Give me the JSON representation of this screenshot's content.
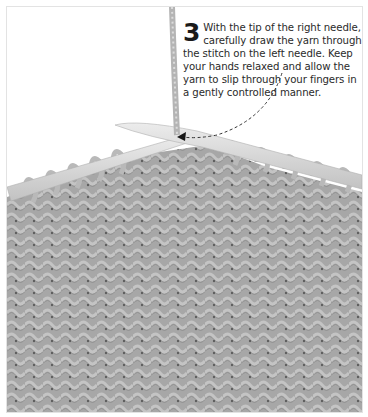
{
  "step": {
    "number": "3",
    "text": "With the tip of the right needle, carefully draw the yarn through the stitch on the left needle. Keep your hands relaxed and allow the yarn to slip through your fingers in a gently controlled manner."
  },
  "illustration": {
    "subject": "knitting-in-progress",
    "fabric_color": "#a9a9a9",
    "needle_color": "#d9d9d9",
    "yarn_color": "#b5b5b5",
    "arrow_style": "dashed"
  }
}
